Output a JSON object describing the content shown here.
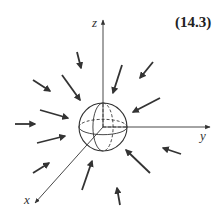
{
  "equation_number": "(14.3)",
  "axes": {
    "x_label": "x",
    "y_label": "y",
    "z_label": "z",
    "origin": [
      103,
      127
    ],
    "x_end": [
      35,
      203
    ],
    "y_end": [
      210,
      127
    ],
    "z_end": [
      103,
      20
    ]
  },
  "sphere": {
    "center": [
      103,
      127
    ],
    "radius": 24
  },
  "colors": {
    "ink": "#333333",
    "background": "#ffffff"
  },
  "arrows": [
    {
      "from": [
        77,
        52
      ],
      "to": [
        81,
        68
      ]
    },
    {
      "from": [
        33,
        80
      ],
      "to": [
        50,
        91
      ]
    },
    {
      "from": [
        62,
        75
      ],
      "to": [
        80,
        100
      ]
    },
    {
      "from": [
        40,
        110
      ],
      "to": [
        68,
        118
      ]
    },
    {
      "from": [
        15,
        124
      ],
      "to": [
        35,
        124
      ]
    },
    {
      "from": [
        37,
        143
      ],
      "to": [
        65,
        136
      ]
    },
    {
      "from": [
        33,
        173
      ],
      "to": [
        49,
        163
      ]
    },
    {
      "from": [
        82,
        190
      ],
      "to": [
        92,
        161
      ]
    },
    {
      "from": [
        120,
        205
      ],
      "to": [
        117,
        188
      ]
    },
    {
      "from": [
        150,
        173
      ],
      "to": [
        126,
        150
      ]
    },
    {
      "from": [
        181,
        154
      ],
      "to": [
        163,
        148
      ]
    },
    {
      "from": [
        160,
        98
      ],
      "to": [
        133,
        112
      ]
    },
    {
      "from": [
        153,
        62
      ],
      "to": [
        140,
        78
      ]
    },
    {
      "from": [
        122,
        65
      ],
      "to": [
        113,
        93
      ]
    }
  ]
}
